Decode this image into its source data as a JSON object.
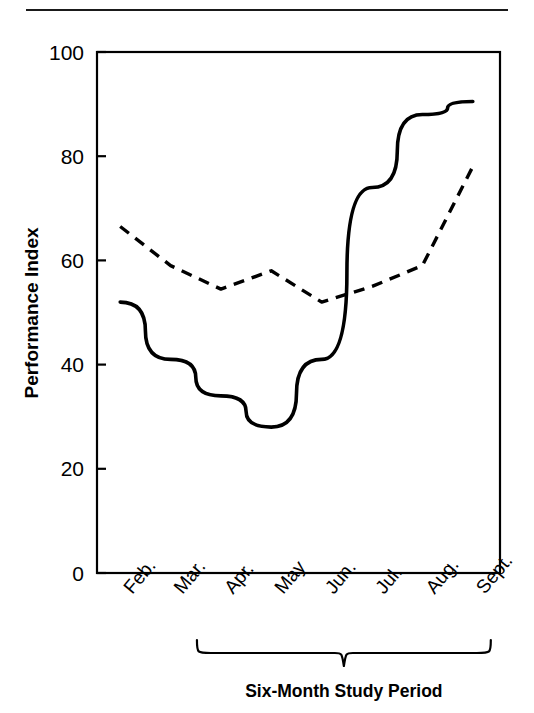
{
  "chart_data": {
    "type": "line",
    "title": "",
    "xlabel": "Six-Month Study Period",
    "ylabel": "Performance Index",
    "categories": [
      "Feb.",
      "Mar.",
      "Apr.",
      "May",
      "Jun.",
      "Jul.",
      "Aug.",
      "Sept."
    ],
    "ylim": [
      0,
      100
    ],
    "yticks": [
      0,
      20,
      40,
      60,
      80,
      100
    ],
    "ytick_labels": [
      "0",
      "20",
      "40",
      "60",
      "80",
      "100"
    ],
    "grid": false,
    "legend": "none",
    "axis_box": true,
    "series": [
      {
        "name": "solid-series",
        "style": "solid",
        "color": "#000000",
        "values": [
          52,
          41,
          34,
          28,
          41,
          74,
          88,
          90.5
        ]
      },
      {
        "name": "dashed-series",
        "style": "dashed",
        "color": "#000000",
        "values": [
          66.5,
          59,
          54.5,
          58,
          52,
          55,
          59,
          78
        ]
      }
    ],
    "annotations": [
      {
        "name": "study-period-brace",
        "text": "Six-Month Study Period",
        "spans_categories": [
          "Apr.",
          "Sept."
        ]
      }
    ]
  },
  "figure": {
    "top_rule": true,
    "background_color": "#ffffff",
    "ink_color": "#000000"
  }
}
